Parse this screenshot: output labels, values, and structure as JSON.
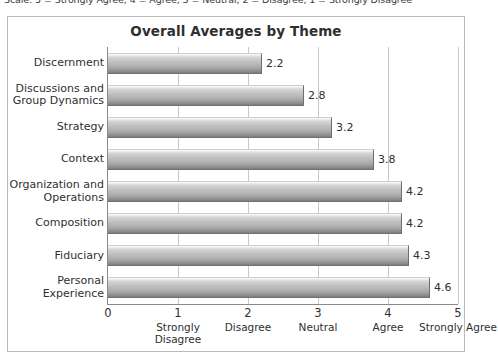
{
  "scale_caption": "Scale: 5 = Strongly Agree, 4 = Agree, 3 = Neutral, 2 = Disagree, 1 = Strongly Disagree",
  "chart_data": {
    "type": "bar",
    "orientation": "horizontal",
    "title": "Overall Averages by Theme",
    "xlabel": "",
    "ylabel": "",
    "xlim": [
      0,
      5
    ],
    "ylim": null,
    "grid": true,
    "legend": null,
    "categories": [
      "Discernment",
      "Discussions and Group Dynamics",
      "Strategy",
      "Context",
      "Organization and Operations",
      "Composition",
      "Fiduciary",
      "Personal Experience"
    ],
    "values": [
      2.2,
      2.8,
      3.2,
      3.8,
      4.2,
      4.2,
      4.3,
      4.6
    ],
    "value_labels": [
      "2.2",
      "2.8",
      "3.2",
      "3.8",
      "4.2",
      "4.2",
      "4.3",
      "4.6"
    ],
    "xticks": [
      0,
      1,
      2,
      3,
      4,
      5
    ],
    "xtick_labels": [
      "0",
      "1",
      "2",
      "3",
      "4",
      "5"
    ],
    "xtick_descriptions": [
      "",
      "Strongly Disagree",
      "Disagree",
      "Neutral",
      "Agree",
      "Strongly Agree"
    ],
    "bar_color": "#b5b5b5",
    "grid_color": "#c8c8c8",
    "axis_color": "#8a8a8a",
    "text_color": "#2f2f2f"
  }
}
